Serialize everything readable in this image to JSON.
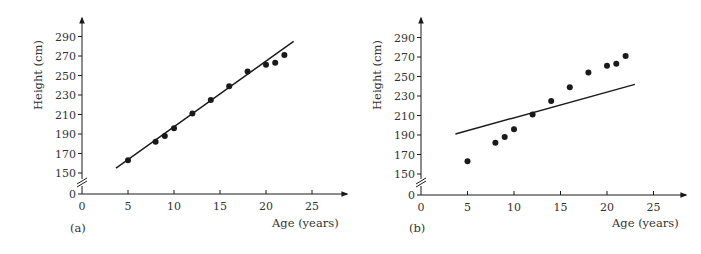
{
  "chart_data": [
    {
      "type": "scatter",
      "panel_label": "(a)",
      "title": "",
      "xlabel": "Age (years)",
      "ylabel": "Height (cm)",
      "x_ticks": [
        0,
        5,
        10,
        15,
        20,
        25
      ],
      "y_ticks": [
        0,
        150,
        170,
        190,
        210,
        230,
        250,
        270,
        290
      ],
      "y_axis_break": true,
      "grid": false,
      "series": [
        {
          "name": "observations",
          "x": [
            5,
            8,
            9,
            10,
            12,
            14,
            16,
            18,
            20,
            21,
            22
          ],
          "y": [
            163,
            182,
            188,
            196,
            211,
            225,
            239,
            254,
            261,
            263,
            271
          ]
        }
      ],
      "fit_line": {
        "x": [
          3.7,
          23.0
        ],
        "y": [
          155,
          285
        ],
        "description": "well-fitting regression line"
      }
    },
    {
      "type": "scatter",
      "panel_label": "(b)",
      "title": "",
      "xlabel": "Age (years)",
      "ylabel": "Height (cm)",
      "x_ticks": [
        0,
        5,
        10,
        15,
        20,
        25
      ],
      "y_ticks": [
        0,
        150,
        170,
        190,
        210,
        230,
        250,
        270,
        290
      ],
      "y_axis_break": true,
      "grid": false,
      "series": [
        {
          "name": "observations",
          "x": [
            5,
            8,
            9,
            10,
            12,
            14,
            16,
            18,
            20,
            21,
            22
          ],
          "y": [
            163,
            182,
            188,
            196,
            211,
            225,
            239,
            254,
            261,
            263,
            271
          ]
        }
      ],
      "fit_line": {
        "x": [
          3.7,
          23.0
        ],
        "y": [
          191,
          242
        ],
        "description": "poorly-fitting line"
      }
    }
  ],
  "colors": {
    "ink": "#1a1a1a",
    "text": "#333333",
    "background": "#ffffff"
  }
}
